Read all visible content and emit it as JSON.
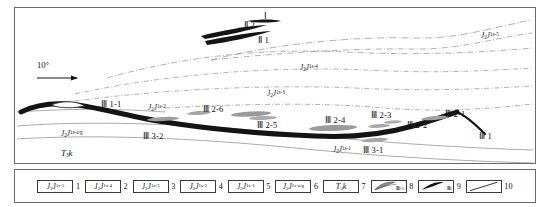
{
  "figure": {
    "type": "geological-cross-section",
    "dip_marker": "10°"
  },
  "section_labels": {
    "strata": [
      {
        "id": "js5",
        "text": "J₂J¹ˢ⁻⁵",
        "base": "J",
        "sub": "2",
        "sup2": "J",
        "supsup": "1s-5"
      },
      {
        "id": "js4",
        "text": "J₂J¹ˢ⁻⁴"
      },
      {
        "id": "js3",
        "text": "J₂J¹ˢ⁻³"
      },
      {
        "id": "js2",
        "text": "J₂J¹ˢ⁻²"
      },
      {
        "id": "js1",
        "text": "J₂J¹ˢ⁻¹"
      },
      {
        "id": "jsag",
        "text": "J₂J¹ˢ⁻ᵃ/ᵍ"
      },
      {
        "id": "t3k",
        "text": "T₃k"
      }
    ],
    "ore_bodies": [
      {
        "id": "I",
        "label": "Ⅰ"
      },
      {
        "id": "II1",
        "label": "Ⅱ 1"
      },
      {
        "id": "II2",
        "label": "Ⅱ 2"
      },
      {
        "id": "III1",
        "label": "Ⅲ 1"
      },
      {
        "id": "III1-1",
        "label": "Ⅲ 1-1"
      },
      {
        "id": "III2-1",
        "label": "Ⅲ 2-1"
      },
      {
        "id": "III2-2",
        "label": "Ⅲ 2-2"
      },
      {
        "id": "III2-3",
        "label": "Ⅲ 2-3"
      },
      {
        "id": "III2-4",
        "label": "Ⅲ 2-4"
      },
      {
        "id": "III2-5",
        "label": "Ⅲ 2-5"
      },
      {
        "id": "III2-6",
        "label": "Ⅲ 2-6"
      },
      {
        "id": "III3-1",
        "label": "Ⅲ 3-1"
      },
      {
        "id": "III3-2",
        "label": "Ⅲ 3-2"
      }
    ]
  },
  "legend": {
    "items": [
      {
        "num": "1",
        "kind": "strat",
        "base": "J",
        "sub": "2",
        "unit": "J",
        "sup": "1s-5"
      },
      {
        "num": "2",
        "kind": "strat",
        "base": "J",
        "sub": "2",
        "unit": "J",
        "sup": "1s-4"
      },
      {
        "num": "3",
        "kind": "strat",
        "base": "J",
        "sub": "2",
        "unit": "J",
        "sup": "1s-3"
      },
      {
        "num": "4",
        "kind": "strat",
        "base": "J",
        "sub": "2",
        "unit": "J",
        "sup": "1s-2"
      },
      {
        "num": "5",
        "kind": "strat",
        "base": "J",
        "sub": "2",
        "unit": "J",
        "sup": "1s-1"
      },
      {
        "num": "6",
        "kind": "strat",
        "base": "J",
        "sub": "2",
        "unit": "J",
        "sup": "1s-a/g"
      },
      {
        "num": "7",
        "kind": "strat",
        "base": "T",
        "sub": "3",
        "unit": "k",
        "sup": ""
      },
      {
        "num": "8",
        "kind": "lens-gray",
        "annot": "Ⅲ2-5"
      },
      {
        "num": "9",
        "kind": "lens-black",
        "annot": "Ⅲ1"
      },
      {
        "num": "10",
        "kind": "line",
        "annot": ""
      }
    ]
  },
  "colors": {
    "frame": "#6a6a6a",
    "ore_black": "#111111",
    "ore_gray": "#9a9a9a",
    "horizon": "#8b8b8b",
    "text": "#111111"
  }
}
